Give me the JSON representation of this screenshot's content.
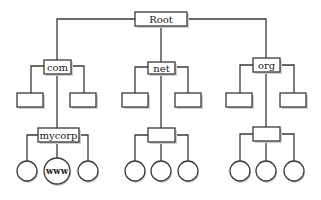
{
  "diagram": {
    "type": "tree",
    "title": "",
    "root": {
      "id": "root",
      "label": "Root",
      "shape": "rect"
    },
    "level1": [
      {
        "id": "com",
        "label": "com",
        "shape": "rect"
      },
      {
        "id": "net",
        "label": "net",
        "shape": "rect"
      },
      {
        "id": "org",
        "label": "org",
        "shape": "rect"
      }
    ],
    "level2": {
      "com": [
        {
          "id": "com-left",
          "label": "",
          "shape": "rect"
        },
        {
          "id": "mycorp",
          "label": "mycorp",
          "shape": "rect"
        },
        {
          "id": "com-right",
          "label": "",
          "shape": "rect"
        }
      ],
      "net": [
        {
          "id": "net-left",
          "label": "",
          "shape": "rect"
        },
        {
          "id": "net-mid",
          "label": "",
          "shape": "rect"
        },
        {
          "id": "net-right",
          "label": "",
          "shape": "rect"
        }
      ],
      "org": [
        {
          "id": "org-left",
          "label": "",
          "shape": "rect"
        },
        {
          "id": "org-mid",
          "label": "",
          "shape": "rect"
        },
        {
          "id": "org-right",
          "label": "",
          "shape": "rect"
        }
      ]
    },
    "level3": {
      "mycorp": [
        {
          "id": "mycorp-c1",
          "label": "",
          "shape": "circle"
        },
        {
          "id": "www",
          "label": "www",
          "shape": "circle"
        },
        {
          "id": "mycorp-c3",
          "label": "",
          "shape": "circle"
        }
      ],
      "net-mid": [
        {
          "id": "net-c1",
          "label": "",
          "shape": "circle"
        },
        {
          "id": "net-c2",
          "label": "",
          "shape": "circle"
        },
        {
          "id": "net-c3",
          "label": "",
          "shape": "circle"
        }
      ],
      "org-mid": [
        {
          "id": "org-c1",
          "label": "",
          "shape": "circle"
        },
        {
          "id": "org-c2",
          "label": "",
          "shape": "circle"
        },
        {
          "id": "org-c3",
          "label": "",
          "shape": "circle"
        }
      ]
    },
    "colors": {
      "stroke": "#3a3a3a",
      "fill": "#ffffff",
      "background": "#ffffff"
    }
  }
}
